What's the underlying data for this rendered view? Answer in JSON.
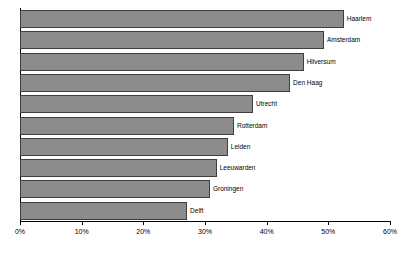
{
  "chart_data": {
    "type": "bar",
    "orientation": "horizontal",
    "title": "",
    "xlabel": "",
    "ylabel": "",
    "xlim": [
      0,
      60
    ],
    "grid": false,
    "legend": "none",
    "x_tick_labels": [
      "0%",
      "10%",
      "20%",
      "30%",
      "40%",
      "50%",
      "60%"
    ],
    "x_ticks": [
      0,
      10,
      20,
      30,
      40,
      50,
      60
    ],
    "categories": [
      "Haarlem",
      "Amsterdam",
      "Hilversum",
      "Den Haag",
      "Utrecht",
      "Rotterdam",
      "Leiden",
      "Leeuwarden",
      "Groningen",
      "Delft"
    ],
    "values": [
      52.5,
      49.3,
      46.0,
      43.8,
      37.8,
      34.7,
      33.7,
      31.9,
      30.8,
      27.1
    ],
    "bars": [
      {
        "label": "Haarlem",
        "value": 52.5
      },
      {
        "label": "Amsterdam",
        "value": 49.3
      },
      {
        "label": "Hilversum",
        "value": 46.0
      },
      {
        "label": "Den Haag",
        "value": 43.8
      },
      {
        "label": "Utrecht",
        "value": 37.8
      },
      {
        "label": "Rotterdam",
        "value": 34.7
      },
      {
        "label": "Leiden",
        "value": 33.7
      },
      {
        "label": "Leeuwarden",
        "value": 31.9
      },
      {
        "label": "Groningen",
        "value": 30.8
      },
      {
        "label": "Delft",
        "value": 27.1
      }
    ],
    "colors": {
      "bar_fill": "#8c8c8c",
      "bar_border": "#3d3d3d",
      "axis": "#000000",
      "text": "#000000",
      "background": "#ffffff"
    }
  }
}
